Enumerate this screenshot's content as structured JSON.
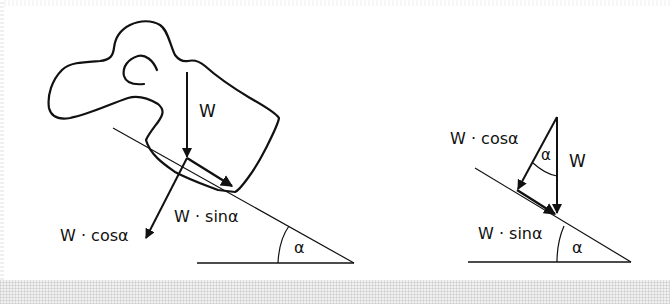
{
  "figure": {
    "type": "inclined-plane-force-decomposition",
    "colors": {
      "stroke": "#111111",
      "background": "#ffffff",
      "bottom_strip": "#f2f2f2"
    },
    "left_panel": {
      "labels": {
        "weight": "W",
        "normal_component": "W · cosα",
        "parallel_component": "W · sinα",
        "incline_angle": "α"
      }
    },
    "right_panel": {
      "labels": {
        "weight": "W",
        "normal_component": "W · cosα",
        "parallel_component": "W · sinα",
        "triangle_angle": "α",
        "incline_angle": "α"
      }
    }
  }
}
